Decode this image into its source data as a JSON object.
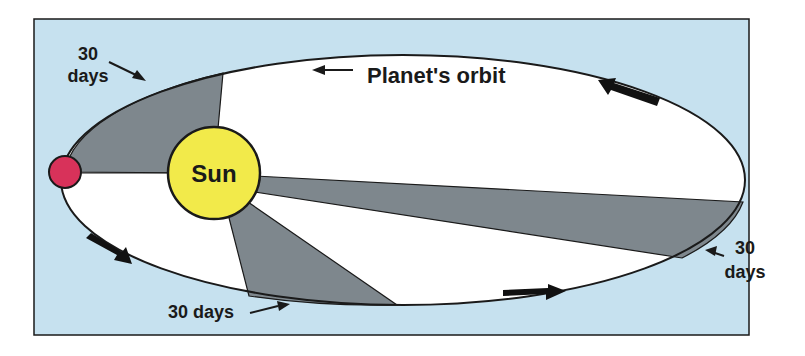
{
  "diagram": {
    "type": "kepler-second-law",
    "labels": {
      "sun": "Sun",
      "orbit": "Planet's orbit",
      "top_left_30": "30",
      "top_left_days": "days",
      "right_30": "30",
      "right_days": "days",
      "bottom": "30 days"
    },
    "colors": {
      "background_panel": "#c6e1ef",
      "orbit_interior": "#ffffff",
      "wedge": "#7e878d",
      "sun": "#f2ea4a",
      "planet": "#d8325a",
      "outline": "#1a1a1a"
    },
    "elements": [
      {
        "name": "Sun",
        "shape": "circle"
      },
      {
        "name": "Planet",
        "shape": "circle"
      },
      {
        "name": "Planet's orbit",
        "shape": "ellipse"
      },
      {
        "name": "30-day swept area (near perihelion)",
        "shape": "wedge"
      },
      {
        "name": "30-day swept area (aphelion side)",
        "shape": "wedge"
      },
      {
        "name": "30-day swept area (lower)",
        "shape": "wedge"
      }
    ]
  }
}
